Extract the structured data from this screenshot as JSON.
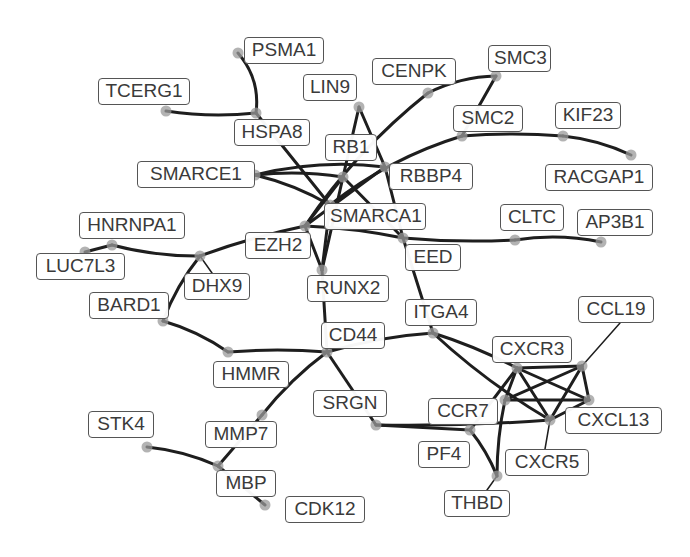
{
  "graph": {
    "type": "network",
    "colors": {
      "edge": "#1e1e1e",
      "node": "#9a9a9a",
      "label_border": "#555555",
      "label_text": "#3a3a3a",
      "background": "#ffffff"
    },
    "nodes": [
      {
        "id": "PSMA1",
        "label": "PSMA1",
        "x": 238,
        "y": 53,
        "lx": 244,
        "ly": 37,
        "lw": 80
      },
      {
        "id": "TCERG1",
        "label": "TCERG1",
        "x": 166,
        "y": 111,
        "lx": 98,
        "ly": 78,
        "lw": 92
      },
      {
        "id": "HSPA8",
        "label": "HSPA8",
        "x": 256,
        "y": 113,
        "lx": 234,
        "ly": 119,
        "lw": 76
      },
      {
        "id": "LIN9",
        "label": "LIN9",
        "x": 359,
        "y": 107,
        "lx": 303,
        "ly": 74,
        "lw": 54
      },
      {
        "id": "CENPK",
        "label": "CENPK",
        "x": 428,
        "y": 93,
        "lx": 372,
        "ly": 58,
        "lw": 84
      },
      {
        "id": "SMC3",
        "label": "SMC3",
        "x": 496,
        "y": 76,
        "lx": 488,
        "ly": 45,
        "lw": 63
      },
      {
        "id": "SMC2",
        "label": "SMC2",
        "x": 462,
        "y": 136,
        "lx": 453,
        "ly": 105,
        "lw": 70
      },
      {
        "id": "KIF23",
        "label": "KIF23",
        "x": 563,
        "y": 136,
        "lx": 555,
        "ly": 102,
        "lw": 66
      },
      {
        "id": "RACGAP1",
        "label": "RACGAP1",
        "x": 631,
        "y": 155,
        "lx": 545,
        "ly": 164,
        "lw": 108
      },
      {
        "id": "RB1",
        "label": "RB1",
        "x": 343,
        "y": 177,
        "lx": 325,
        "ly": 134,
        "lw": 52
      },
      {
        "id": "SMARCE1",
        "label": "SMARCE1",
        "x": 255,
        "y": 175,
        "lx": 137,
        "ly": 161,
        "lw": 118
      },
      {
        "id": "RBBP4",
        "label": "RBBP4",
        "x": 385,
        "y": 167,
        "lx": 389,
        "ly": 163,
        "lw": 84
      },
      {
        "id": "SMARCA1",
        "label": "SMARCA1",
        "x": 330,
        "y": 205,
        "lx": 324,
        "ly": 203,
        "lw": 102
      },
      {
        "id": "EZH2",
        "label": "EZH2",
        "x": 305,
        "y": 226,
        "lx": 245,
        "ly": 232,
        "lw": 66
      },
      {
        "id": "HNRNPA1",
        "label": "HNRNPA1",
        "x": 112,
        "y": 245,
        "lx": 79,
        "ly": 212,
        "lw": 106
      },
      {
        "id": "LUC7L3",
        "label": "LUC7L3",
        "x": 85,
        "y": 252,
        "lx": 36,
        "ly": 253,
        "lw": 89
      },
      {
        "id": "DHX9",
        "label": "DHX9",
        "x": 200,
        "y": 256,
        "lx": 184,
        "ly": 273,
        "lw": 66
      },
      {
        "id": "BARD1",
        "label": "BARD1",
        "x": 163,
        "y": 321,
        "lx": 89,
        "ly": 292,
        "lw": 80
      },
      {
        "id": "RUNX2",
        "label": "RUNX2",
        "x": 322,
        "y": 270,
        "lx": 307,
        "ly": 275,
        "lw": 82
      },
      {
        "id": "EED",
        "label": "EED",
        "x": 403,
        "y": 238,
        "lx": 405,
        "ly": 244,
        "lw": 56
      },
      {
        "id": "CLTC",
        "label": "CLTC",
        "x": 515,
        "y": 240,
        "lx": 500,
        "ly": 204,
        "lw": 64
      },
      {
        "id": "AP3B1",
        "label": "AP3B1",
        "x": 601,
        "y": 242,
        "lx": 577,
        "ly": 209,
        "lw": 76
      },
      {
        "id": "ITGA4",
        "label": "ITGA4",
        "x": 433,
        "y": 333,
        "lx": 405,
        "ly": 299,
        "lw": 72
      },
      {
        "id": "CCL19",
        "label": "CCL19",
        "x": 582,
        "y": 366,
        "lx": 578,
        "ly": 296,
        "lw": 76
      },
      {
        "id": "CD44",
        "label": "CD44",
        "x": 327,
        "y": 352,
        "lx": 321,
        "ly": 322,
        "lw": 64
      },
      {
        "id": "HMMR",
        "label": "HMMR",
        "x": 228,
        "y": 352,
        "lx": 213,
        "ly": 361,
        "lw": 76
      },
      {
        "id": "CXCR3",
        "label": "CXCR3",
        "x": 517,
        "y": 368,
        "lx": 492,
        "ly": 336,
        "lw": 80
      },
      {
        "id": "CXCL13",
        "label": "CXCL13",
        "x": 589,
        "y": 400,
        "lx": 565,
        "ly": 407,
        "lw": 97
      },
      {
        "id": "CXCR5",
        "label": "CXCR5",
        "x": 550,
        "y": 420,
        "lx": 505,
        "ly": 449,
        "lw": 84
      },
      {
        "id": "CCR7",
        "label": "CCR7",
        "x": 505,
        "y": 400,
        "lx": 428,
        "ly": 398,
        "lw": 70
      },
      {
        "id": "SRGN",
        "label": "SRGN",
        "x": 376,
        "y": 425,
        "lx": 313,
        "ly": 390,
        "lw": 74
      },
      {
        "id": "PF4",
        "label": "PF4",
        "x": 470,
        "y": 430,
        "lx": 418,
        "ly": 441,
        "lw": 52
      },
      {
        "id": "THBD",
        "label": "THBD",
        "x": 497,
        "y": 476,
        "lx": 444,
        "ly": 490,
        "lw": 66
      },
      {
        "id": "STK4",
        "label": "STK4",
        "x": 147,
        "y": 447,
        "lx": 88,
        "ly": 411,
        "lw": 66
      },
      {
        "id": "MMP7",
        "label": "MMP7",
        "x": 262,
        "y": 415,
        "lx": 205,
        "ly": 421,
        "lw": 72
      },
      {
        "id": "MBP",
        "label": "MBP",
        "x": 218,
        "y": 466,
        "lx": 216,
        "ly": 470,
        "lw": 60
      },
      {
        "id": "CDK12",
        "label": "CDK12",
        "x": 265,
        "y": 505,
        "lx": 285,
        "ly": 496,
        "lw": 80
      }
    ],
    "edges": [
      {
        "from": "PSMA1",
        "to": "HSPA8",
        "curve": -14
      },
      {
        "from": "TCERG1",
        "to": "HSPA8",
        "curve": 6
      },
      {
        "from": "HSPA8",
        "to": "SMARCA1",
        "curve": 0
      },
      {
        "from": "LIN9",
        "to": "RB1",
        "curve": 0
      },
      {
        "from": "LIN9",
        "to": "RBBP4",
        "curve": 0
      },
      {
        "from": "RBBP4",
        "to": "EED",
        "curve": 0
      },
      {
        "from": "CENPK",
        "to": "SMC3",
        "curve": -8
      },
      {
        "from": "CENPK",
        "to": "EZH2",
        "curve": 14
      },
      {
        "from": "SMC3",
        "to": "SMC2",
        "curve": 0
      },
      {
        "from": "SMC2",
        "to": "KIF23",
        "curve": -4
      },
      {
        "from": "KIF23",
        "to": "RACGAP1",
        "curve": -6
      },
      {
        "from": "SMC2",
        "to": "SMARCA1",
        "curve": 14
      },
      {
        "from": "SMARCE1",
        "to": "RB1",
        "curve": -6
      },
      {
        "from": "SMARCE1",
        "to": "SMARCA1",
        "curve": -6
      },
      {
        "from": "SMARCE1",
        "to": "RBBP4",
        "curve": -12
      },
      {
        "from": "RB1",
        "to": "EZH2",
        "curve": 0
      },
      {
        "from": "RB1",
        "to": "RUNX2",
        "curve": 0
      },
      {
        "from": "RB1",
        "to": "EED",
        "curve": 0
      },
      {
        "from": "RBBP4",
        "to": "EZH2",
        "curve": 0
      },
      {
        "from": "EZH2",
        "to": "DHX9",
        "curve": 4
      },
      {
        "from": "EZH2",
        "to": "RUNX2",
        "curve": 0
      },
      {
        "from": "SMARCA1",
        "to": "RUNX2",
        "curve": 0
      },
      {
        "from": "EZH2",
        "to": "EED",
        "curve": -4
      },
      {
        "from": "EED",
        "to": "CLTC",
        "curve": 4
      },
      {
        "from": "CLTC",
        "to": "AP3B1",
        "curve": -8
      },
      {
        "from": "HNRNPA1",
        "to": "LUC7L3",
        "curve": 0
      },
      {
        "from": "HNRNPA1",
        "to": "DHX9",
        "curve": 6
      },
      {
        "from": "DHX9",
        "to": "BARD1",
        "curve": 6
      },
      {
        "from": "DHX9",
        "to": "DHX9b",
        "curve": 0
      },
      {
        "from": "BARD1",
        "to": "HMMR",
        "curve": -6
      },
      {
        "from": "HMMR",
        "to": "CD44",
        "curve": -4
      },
      {
        "from": "RUNX2",
        "to": "CD44",
        "curve": 0
      },
      {
        "from": "EED",
        "to": "ITGA4",
        "curve": 0
      },
      {
        "from": "CD44",
        "to": "ITGA4",
        "curve": -6
      },
      {
        "from": "CD44",
        "to": "SRGN",
        "curve": 0
      },
      {
        "from": "CD44",
        "to": "MMP7",
        "curve": 6
      },
      {
        "from": "MMP7",
        "to": "MBP",
        "curve": 0
      },
      {
        "from": "STK4",
        "to": "MBP",
        "curve": -6
      },
      {
        "from": "MBP",
        "to": "CDK12",
        "curve": 0
      },
      {
        "from": "ITGA4",
        "to": "CXCR3",
        "curve": -4
      },
      {
        "from": "ITGA4",
        "to": "CXCR5",
        "curve": 8
      },
      {
        "from": "CXCR3",
        "to": "CCL19",
        "curve": 0
      },
      {
        "from": "CXCR3",
        "to": "CXCL13",
        "curve": 0
      },
      {
        "from": "CXCR3",
        "to": "CXCR5",
        "curve": 0
      },
      {
        "from": "CXCR3",
        "to": "CCR7",
        "curve": 0
      },
      {
        "from": "CXCR3",
        "to": "PF4",
        "curve": 0
      },
      {
        "from": "CCL19",
        "to": "CXCL13",
        "curve": 0
      },
      {
        "from": "CCL19",
        "to": "CXCR5",
        "curve": 0
      },
      {
        "from": "CCL19",
        "to": "CCR7",
        "curve": 0
      },
      {
        "from": "CCR7",
        "to": "CXCL13",
        "curve": 0
      },
      {
        "from": "CCR7",
        "to": "THBD",
        "curve": 4
      },
      {
        "from": "CXCR5",
        "to": "CXCL13",
        "curve": 0
      },
      {
        "from": "SRGN",
        "to": "CXCR5",
        "curve": 4
      },
      {
        "from": "SRGN",
        "to": "PF4",
        "curve": 0
      },
      {
        "from": "PF4",
        "to": "THBD",
        "curve": -4
      }
    ],
    "thin_edges": [
      {
        "from": "CCL19",
        "to": "CCL19_label"
      },
      {
        "from": "CXCR5",
        "to": "CXCR5_label"
      },
      {
        "from": "THBD",
        "to": "THBD_label"
      },
      {
        "from": "DHX9",
        "to": "DHX9_label"
      }
    ]
  }
}
